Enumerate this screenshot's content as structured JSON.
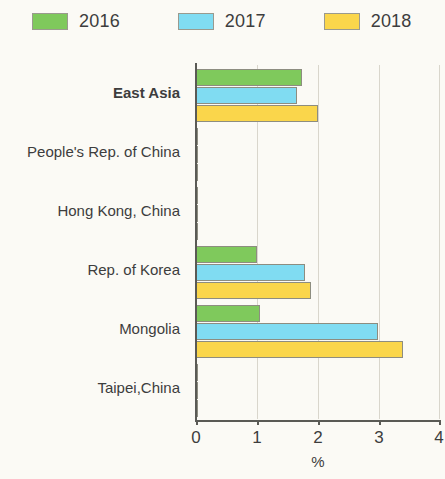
{
  "legend": {
    "items": [
      {
        "label": "2016",
        "color": "#7fc95c",
        "key": "2016"
      },
      {
        "label": "2017",
        "color": "#80dcf2",
        "key": "2017"
      },
      {
        "label": "2018",
        "color": "#fad64b",
        "key": "2018"
      }
    ]
  },
  "axis": {
    "x_title": "%",
    "x_ticks": [
      "0",
      "1",
      "2",
      "3",
      "4"
    ]
  },
  "chart_data": {
    "type": "bar",
    "orientation": "horizontal",
    "title": "",
    "subtitle": "",
    "xlabel": "%",
    "ylabel": "",
    "xlim": [
      0,
      4
    ],
    "xticks": [
      0,
      1,
      2,
      3,
      4
    ],
    "grid": true,
    "legend_position": "top-left",
    "categories": [
      "East Asia",
      "People's Rep. of China",
      "Hong Kong, China",
      "Rep. of Korea",
      "Mongolia",
      "Taipei,China"
    ],
    "emphasized_categories": [
      "East Asia"
    ],
    "series": [
      {
        "name": "2016",
        "color": "#7fc95c",
        "values": [
          1.75,
          2.0,
          2.4,
          1.0,
          1.05,
          1.4
        ]
      },
      {
        "name": "2017",
        "color": "#80dcf2",
        "values": [
          1.67,
          1.8,
          1.7,
          1.8,
          3.0,
          1.1
        ]
      },
      {
        "name": "2018",
        "color": "#fad64b",
        "values": [
          2.0,
          2.4,
          1.8,
          1.9,
          3.4,
          1.2
        ]
      }
    ]
  }
}
